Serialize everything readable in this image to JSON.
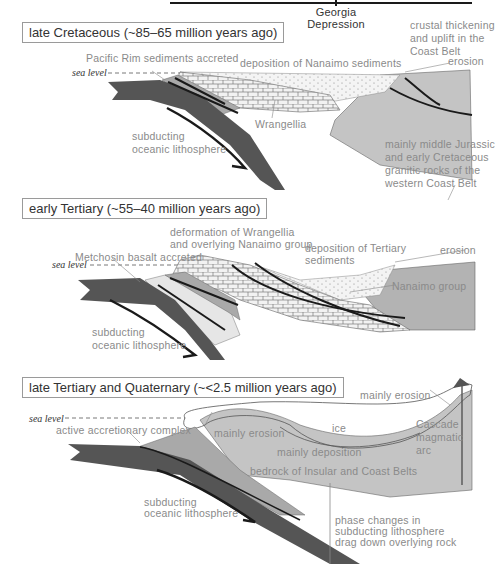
{
  "header": {
    "region_label": "Georgia Depression"
  },
  "panels": [
    {
      "period": "late Cretaceous (~85–65 million years ago)",
      "labels": {
        "sea_level": "sea level",
        "pacific_rim": "Pacific Rim sediments accreted",
        "nanaimo_deposition": "deposition of Nanaimo sediments",
        "crustal_thickening": [
          "crustal thickening",
          "and uplift in the",
          "Coast Belt"
        ],
        "erosion": "erosion",
        "wrangellia": "Wrangellia",
        "subducting": [
          "subducting",
          "oceanic lithosphere"
        ],
        "granitic": [
          "mainly middle Jurassic",
          "and early Cretaceous",
          "granitic rocks of the",
          "western Coast Belt"
        ]
      }
    },
    {
      "period": "early Tertiary (~55–40 million years ago)",
      "labels": {
        "sea_level": "sea level",
        "deformation": [
          "deformation of Wrangellia",
          "and overlying Nanaimo group"
        ],
        "metchosin": "Metchosin basalt accreted",
        "tertiary_deposition": [
          "deposition of Tertiary",
          "sediments"
        ],
        "erosion": "erosion",
        "nanaimo_group": "Nanaimo group",
        "subducting": [
          "subducting",
          "oceanic lithosphere"
        ]
      }
    },
    {
      "period": "late Tertiary and Quaternary (~<2.5 million years ago)",
      "labels": {
        "sea_level": "sea level",
        "accretionary": "active accretionary complex",
        "mainly_erosion_left": "mainly erosion",
        "ice": "ice",
        "mainly_erosion_right": "mainly erosion",
        "cascade": [
          "Cascade",
          "magmatic",
          "arc"
        ],
        "mainly_deposition": "mainly deposition",
        "bedrock": "bedrock of Insular and Coast Belts",
        "subducting": [
          "subducting",
          "oceanic lithosphere"
        ],
        "phase_changes": [
          "phase changes in",
          "subducting lithosphere",
          "drag down overlying rock"
        ]
      }
    }
  ],
  "colors": {
    "oceanic_plate": "#555555",
    "light_gray_crust": "#c4c4c4",
    "mid_gray": "#a9a9a9",
    "sediment_fill": "#eeeeee",
    "label_text": "#8a8a8a",
    "fault_line": "#1a1a1a"
  }
}
